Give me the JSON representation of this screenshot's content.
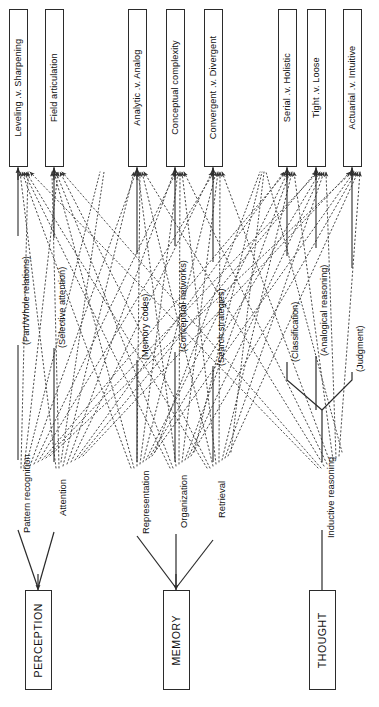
{
  "diagram": {
    "orientation": "rotated-90-ccw",
    "modules": [
      {
        "id": "perception",
        "label": "PERCEPTION"
      },
      {
        "id": "memory",
        "label": "MEMORY"
      },
      {
        "id": "thought",
        "label": "THOUGHT"
      }
    ],
    "processes": [
      {
        "id": "pattern-recognition",
        "label": "Pattern recognition",
        "paren": "(Part/Whole relations)",
        "module": "perception"
      },
      {
        "id": "attention",
        "label": "Attention",
        "paren": "(Selective attention)",
        "module": "perception"
      },
      {
        "id": "representation",
        "label": "Representation",
        "paren": "(Memory codes)",
        "module": "memory"
      },
      {
        "id": "organization",
        "label": "Organization",
        "paren": "(Conceptual networks)",
        "module": "memory"
      },
      {
        "id": "retrieval",
        "label": "Retrieval",
        "paren": "(Search strategies)",
        "module": "memory"
      },
      {
        "id": "inductive-reasoning",
        "label": "Inductive reasoning",
        "paren": "(Classification)",
        "module": "thought"
      },
      {
        "id": "analogical",
        "label": "",
        "paren": "(Analogical reasoning)",
        "module": "thought"
      },
      {
        "id": "judgment",
        "label": "",
        "paren": "(Judgment)",
        "module": "thought"
      }
    ],
    "dimensions": [
      {
        "id": "leveling-sharpening",
        "label": "Leveling .v. Sharpening"
      },
      {
        "id": "field-articulation",
        "label": "Field articulation"
      },
      {
        "id": "analytic-analog",
        "label": "Analytic .v. Analog"
      },
      {
        "id": "conceptual-complexity",
        "label": "Conceptual complexity"
      },
      {
        "id": "convergent-divergent",
        "label": "Convergent .v. Divergent"
      },
      {
        "id": "serial-holistic",
        "label": "Serial .v. Holistic"
      },
      {
        "id": "tight-loose",
        "label": "Tight .v. Loose"
      },
      {
        "id": "actuarial-intuitive",
        "label": "Actuarial .v. Intuitive"
      }
    ],
    "colors": {
      "stroke": "#2b2b2b",
      "dotted": "#555555",
      "background": "#ffffff"
    }
  }
}
